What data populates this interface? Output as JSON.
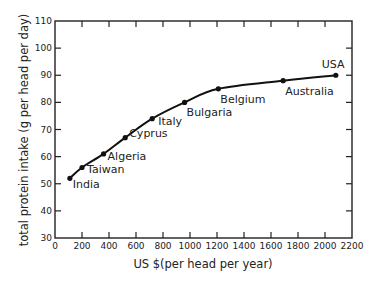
{
  "chart_data": {
    "type": "scatter",
    "title": "",
    "xlabel": "US $(per head per year)",
    "ylabel": "total protein intake (g per head per day)",
    "xlim": [
      0,
      2200
    ],
    "ylim": [
      30,
      110
    ],
    "x_ticks": [
      0,
      200,
      400,
      600,
      800,
      1000,
      1200,
      1400,
      1600,
      1800,
      2000,
      2200
    ],
    "x_tick_labels": [
      "0",
      "200",
      "400",
      "600",
      "800",
      "1000",
      "1200",
      "1400",
      "1600",
      "1800",
      "2000",
      "2200"
    ],
    "y_ticks": [
      30,
      40,
      50,
      60,
      70,
      80,
      90,
      100,
      110
    ],
    "y_tick_labels": [
      "30",
      "40",
      "50",
      "60",
      "70",
      "80",
      "90",
      "100",
      "110"
    ],
    "grid": false,
    "legend": null,
    "trend_line": "smooth fitted curve through points",
    "points": [
      {
        "label": "India",
        "x": 110,
        "y": 52
      },
      {
        "label": "Taiwan",
        "x": 200,
        "y": 56
      },
      {
        "label": "Algeria",
        "x": 360,
        "y": 61
      },
      {
        "label": "Cyprus",
        "x": 520,
        "y": 67
      },
      {
        "label": "Italy",
        "x": 720,
        "y": 74
      },
      {
        "label": "Bulgaria",
        "x": 960,
        "y": 80
      },
      {
        "label": "Belgium",
        "x": 1210,
        "y": 85
      },
      {
        "label": "Australia",
        "x": 1690,
        "y": 88
      },
      {
        "label": "USA",
        "x": 2080,
        "y": 90
      }
    ]
  }
}
